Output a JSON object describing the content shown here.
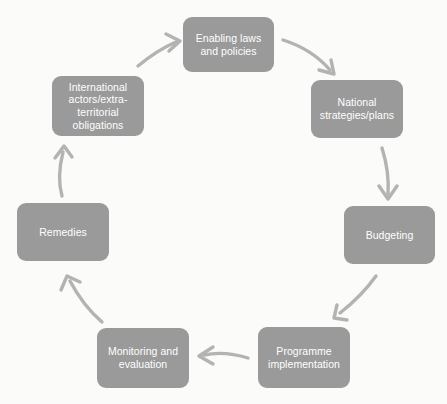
{
  "diagram": {
    "type": "cycle-flow",
    "title": "",
    "background_color": "#fbfbfa",
    "node_color": "#9a9a9a",
    "node_text_color": "#ffffff",
    "arrow_color": "#b3b3b3",
    "node_count": 7,
    "arrow_count": 7,
    "direction": "clockwise",
    "nodes": [
      {
        "id": "enabling-laws-and-policies",
        "label": "Enabling laws\nand policies",
        "order": 1,
        "x": 183,
        "y": 17,
        "width": 91,
        "height": 55
      },
      {
        "id": "national-strategies-plans",
        "label": "National\nstrategies/plans",
        "order": 2,
        "x": 311,
        "y": 80,
        "width": 92,
        "height": 58
      },
      {
        "id": "budgeting",
        "label": "Budgeting",
        "order": 3,
        "x": 344,
        "y": 206,
        "width": 91,
        "height": 58
      },
      {
        "id": "programme-implementation",
        "label": "Programme\nimplementation",
        "order": 4,
        "x": 258,
        "y": 327,
        "width": 92,
        "height": 61
      },
      {
        "id": "monitoring-and-evaluation",
        "label": "Monitoring and\nevaluation",
        "order": 5,
        "x": 97,
        "y": 328,
        "width": 92,
        "height": 60
      },
      {
        "id": "remedies",
        "label": "Remedies",
        "order": 6,
        "x": 17,
        "y": 203,
        "width": 92,
        "height": 58
      },
      {
        "id": "international-actors-extraterritorial-obligations",
        "label": "International\nactors/extra-\nterritorial\nobligations",
        "order": 7,
        "x": 52,
        "y": 76,
        "width": 92,
        "height": 60
      }
    ],
    "arrows": [
      {
        "id": "arrow-international-to-enabling",
        "from": "international-actors-extraterritorial-obligations",
        "to": "enabling-laws-and-policies",
        "shape": "curve-up-right"
      },
      {
        "id": "arrow-enabling-to-national",
        "from": "enabling-laws-and-policies",
        "to": "national-strategies-plans",
        "shape": "curve-down-right"
      },
      {
        "id": "arrow-national-to-budgeting",
        "from": "national-strategies-plans",
        "to": "budgeting",
        "shape": "curve-down"
      },
      {
        "id": "arrow-budgeting-to-programme",
        "from": "budgeting",
        "to": "programme-implementation",
        "shape": "curve-down-left"
      },
      {
        "id": "arrow-programme-to-monitoring",
        "from": "programme-implementation",
        "to": "monitoring-and-evaluation",
        "shape": "curve-left"
      },
      {
        "id": "arrow-monitoring-to-remedies",
        "from": "monitoring-and-evaluation",
        "to": "remedies",
        "shape": "curve-up-left"
      },
      {
        "id": "arrow-remedies-to-international",
        "from": "remedies",
        "to": "international-actors-extraterritorial-obligations",
        "shape": "curve-up"
      }
    ]
  }
}
